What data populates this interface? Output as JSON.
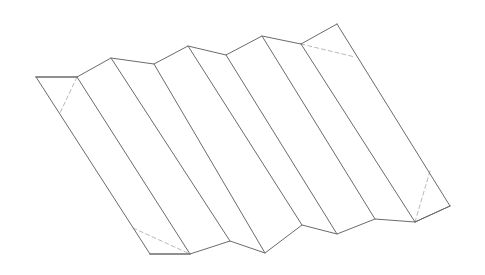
{
  "figure": {
    "type": "line-drawing",
    "canvas": {
      "width": 485,
      "height": 275,
      "background": "#ffffff"
    },
    "style": {
      "solid_edge_color": "#6b6b6b",
      "hidden_edge_color": "#b9b9b9",
      "facet_fill": "#ffffff",
      "stroke_width": 1,
      "dash_pattern": "4 3"
    },
    "top_profile": {
      "label": "top zigzag crease line",
      "points": [
        {
          "name": "top-left-corner",
          "x": 36,
          "y": 77,
          "kind": "corner"
        },
        {
          "name": "top-valley-0",
          "x": 77,
          "y": 77,
          "kind": "valley"
        },
        {
          "name": "top-peak-1",
          "x": 111,
          "y": 58,
          "kind": "peak"
        },
        {
          "name": "top-valley-1",
          "x": 154,
          "y": 64,
          "kind": "valley"
        },
        {
          "name": "top-peak-2",
          "x": 188,
          "y": 46,
          "kind": "peak"
        },
        {
          "name": "top-valley-2",
          "x": 226,
          "y": 55,
          "kind": "valley"
        },
        {
          "name": "top-peak-3",
          "x": 262,
          "y": 36,
          "kind": "peak"
        },
        {
          "name": "top-valley-3",
          "x": 301,
          "y": 44,
          "kind": "valley"
        },
        {
          "name": "top-right-corner",
          "x": 337,
          "y": 24,
          "kind": "corner"
        }
      ]
    },
    "bottom_profile": {
      "label": "bottom zigzag crease line",
      "points": [
        {
          "name": "bottom-left-corner",
          "x": 150,
          "y": 254,
          "kind": "corner"
        },
        {
          "name": "bottom-valley-0",
          "x": 190,
          "y": 254,
          "kind": "valley"
        },
        {
          "name": "bottom-peak-1",
          "x": 230,
          "y": 241,
          "kind": "peak"
        },
        {
          "name": "bottom-valley-1",
          "x": 265,
          "y": 253,
          "kind": "valley"
        },
        {
          "name": "bottom-peak-2",
          "x": 302,
          "y": 225,
          "kind": "peak"
        },
        {
          "name": "bottom-valley-2",
          "x": 337,
          "y": 234,
          "kind": "valley"
        },
        {
          "name": "bottom-peak-3",
          "x": 375,
          "y": 219,
          "kind": "peak"
        },
        {
          "name": "bottom-valley-3",
          "x": 415,
          "y": 222,
          "kind": "valley"
        },
        {
          "name": "bottom-right-corner",
          "x": 450,
          "y": 206,
          "kind": "corner"
        }
      ]
    },
    "fold_lines": [
      {
        "name": "fold-line-left-edge",
        "from": [
          36,
          77
        ],
        "to": [
          150,
          254
        ],
        "visible": true
      },
      {
        "name": "fold-line-1",
        "from": [
          77,
          77
        ],
        "to": [
          190,
          254
        ],
        "visible": true
      },
      {
        "name": "fold-line-2",
        "from": [
          111,
          58
        ],
        "to": [
          230,
          241
        ],
        "visible": true
      },
      {
        "name": "fold-line-3",
        "from": [
          154,
          64
        ],
        "to": [
          265,
          253
        ],
        "visible": true
      },
      {
        "name": "fold-line-4",
        "from": [
          188,
          46
        ],
        "to": [
          302,
          225
        ],
        "visible": true
      },
      {
        "name": "fold-line-5",
        "from": [
          226,
          55
        ],
        "to": [
          337,
          234
        ],
        "visible": true
      },
      {
        "name": "fold-line-6",
        "from": [
          262,
          36
        ],
        "to": [
          375,
          219
        ],
        "visible": true
      },
      {
        "name": "fold-line-7",
        "from": [
          301,
          44
        ],
        "to": [
          415,
          222
        ],
        "visible": true
      },
      {
        "name": "fold-line-right-edge",
        "from": [
          337,
          24
        ],
        "to": [
          450,
          206
        ],
        "visible": true
      }
    ],
    "hidden_lines": [
      {
        "name": "hidden-fold-top-left",
        "from": [
          77,
          77
        ],
        "to": [
          60,
          113
        ]
      },
      {
        "name": "hidden-fold-top-right",
        "from": [
          301,
          44
        ],
        "to": [
          355,
          57
        ]
      },
      {
        "name": "hidden-fold-bottom-left",
        "from": [
          133,
          228
        ],
        "to": [
          190,
          254
        ]
      },
      {
        "name": "hidden-fold-bottom-right",
        "from": [
          415,
          222
        ],
        "to": [
          430,
          171
        ]
      }
    ],
    "closing_edges": [
      {
        "name": "left-cap-edge",
        "from": [
          36,
          77
        ],
        "to": [
          77,
          77
        ],
        "note": "horizontal top-left cap"
      },
      {
        "name": "bottom-cap-edge",
        "from": [
          150,
          254
        ],
        "to": [
          190,
          254
        ],
        "note": "horizontal bottom-left cap"
      },
      {
        "name": "right-cap-edge",
        "from": [
          415,
          222
        ],
        "to": [
          450,
          206
        ],
        "note": "bottom-right cap"
      }
    ],
    "counts": {
      "pleats": 8,
      "peaks": 3,
      "valleys": 4
    }
  }
}
